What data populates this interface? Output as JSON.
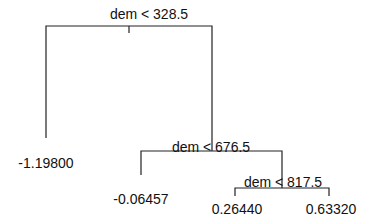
{
  "tree": {
    "splits": [
      {
        "id": "root",
        "label": "dem < 328.5"
      },
      {
        "id": "node2",
        "label": "dem < 676.5"
      },
      {
        "id": "node3",
        "label": "dem < 817.5"
      }
    ],
    "leaves": [
      {
        "id": "leaf1",
        "value": "-1.19800"
      },
      {
        "id": "leaf2",
        "value": "-0.06457"
      },
      {
        "id": "leaf3",
        "value": "0.26440"
      },
      {
        "id": "leaf4",
        "value": "0.63320"
      }
    ],
    "line_color": "#222222"
  }
}
